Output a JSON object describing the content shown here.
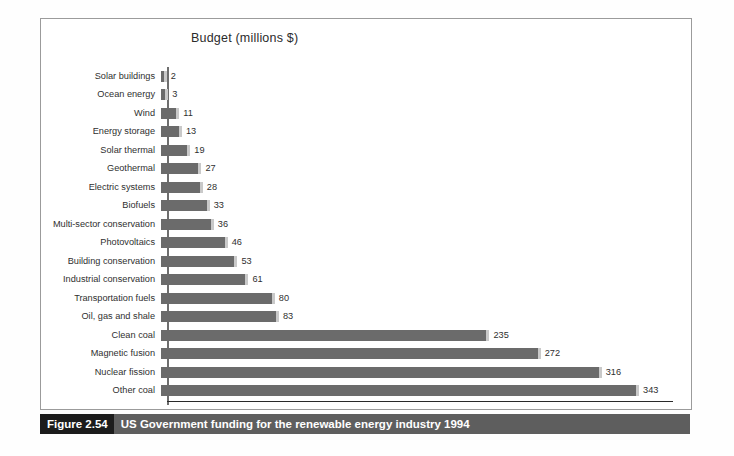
{
  "figure": {
    "caption_number": "Figure 2.54",
    "caption_text": "US Government funding for the renewable energy industry 1994"
  },
  "chart_data": {
    "type": "bar",
    "orientation": "horizontal",
    "title": "Budget (millions $)",
    "xlabel": "",
    "ylabel": "",
    "grid": false,
    "legend": null,
    "xlim": [
      0,
      360
    ],
    "bar_color": "#6b6b6b",
    "shadow_color": "#c9c9c9",
    "categories": [
      "Solar buildings",
      "Ocean energy",
      "Wind",
      "Energy storage",
      "Solar thermal",
      "Geothermal",
      "Electric systems",
      "Biofuels",
      "Multi-sector conservation",
      "Photovoltaics",
      "Building conservation",
      "Industrial conservation",
      "Transportation fuels",
      "Oil, gas and shale",
      "Clean coal",
      "Magnetic fusion",
      "Nuclear fission",
      "Other coal"
    ],
    "values": [
      2,
      3,
      11,
      13,
      19,
      27,
      28,
      33,
      36,
      46,
      53,
      61,
      80,
      83,
      235,
      272,
      316,
      343
    ],
    "value_labels": [
      "2",
      "3",
      "11",
      "13",
      "19",
      "27",
      "28",
      "33",
      "36",
      "46",
      "53",
      "61",
      "80",
      "83",
      "235",
      "272",
      "316",
      "343"
    ]
  }
}
